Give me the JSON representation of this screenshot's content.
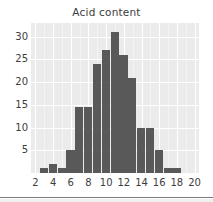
{
  "chart_data": {
    "type": "bar",
    "title": "Acid content",
    "xlabel": "",
    "ylabel": "",
    "grid": true,
    "legend": false,
    "xlim": [
      1.5,
      20.5
    ],
    "ylim": [
      0,
      33
    ],
    "bin_width": 1,
    "categories": [
      2,
      3,
      4,
      5,
      6,
      7,
      8,
      9,
      10,
      11,
      12,
      13,
      14,
      15,
      16,
      17,
      18,
      19
    ],
    "values": [
      0,
      1,
      2,
      1,
      5,
      14.5,
      14.5,
      24,
      27,
      31,
      26,
      21,
      10,
      10,
      5,
      1,
      1,
      0
    ],
    "xticks": [
      2,
      4,
      6,
      8,
      10,
      12,
      14,
      16,
      18,
      20
    ],
    "yticks": [
      5,
      10,
      15,
      20,
      25,
      30
    ],
    "bar_color": "#595959",
    "plot_background": "#ebebeb",
    "grid_color": "#ffffff",
    "text_color": "#3d3d3d"
  },
  "figure": {
    "title": "Acid content",
    "background": "#ffffff"
  }
}
